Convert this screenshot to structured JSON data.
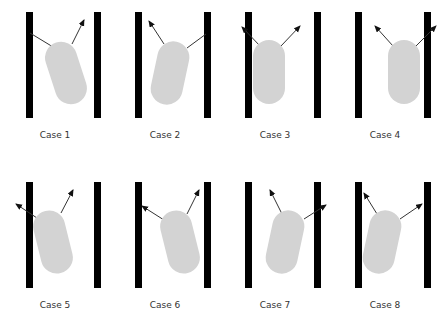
{
  "figure": {
    "colors": {
      "wall": "#000000",
      "body": "#d3d3d3",
      "arrow": "#333333",
      "label": "#333333"
    },
    "cases": [
      {
        "label": "Case 1",
        "left": 0,
        "top": 0,
        "tilt": -18,
        "cx": 66,
        "cy": 73,
        "arrows": [
          {
            "x1": 58,
            "y1": 50,
            "x2": 30,
            "y2": 33,
            "head": false
          },
          {
            "x1": 72,
            "y1": 44,
            "x2": 84,
            "y2": 20,
            "head": true
          }
        ]
      },
      {
        "label": "Case 2",
        "left": 110,
        "top": 0,
        "tilt": 12,
        "cx": 60,
        "cy": 73,
        "arrows": [
          {
            "x1": 54,
            "y1": 44,
            "x2": 39,
            "y2": 21,
            "head": true
          },
          {
            "x1": 77,
            "y1": 48,
            "x2": 96,
            "y2": 34,
            "head": false
          }
        ]
      },
      {
        "label": "Case 3",
        "left": 220,
        "top": 0,
        "tilt": 0,
        "cx": 49,
        "cy": 72,
        "arrows": [
          {
            "x1": 40,
            "y1": 46,
            "x2": 22,
            "y2": 27,
            "head": true
          },
          {
            "x1": 61,
            "y1": 46,
            "x2": 80,
            "y2": 26,
            "head": true
          }
        ]
      },
      {
        "label": "Case 4",
        "left": 330,
        "top": 0,
        "tilt": 0,
        "cx": 74,
        "cy": 72,
        "arrows": [
          {
            "x1": 63,
            "y1": 46,
            "x2": 45,
            "y2": 26,
            "head": true
          },
          {
            "x1": 86,
            "y1": 46,
            "x2": 106,
            "y2": 26,
            "head": true
          }
        ]
      },
      {
        "label": "Case 5",
        "left": 0,
        "top": 170,
        "tilt": -14,
        "cx": 53,
        "cy": 72,
        "arrows": [
          {
            "x1": 40,
            "y1": 50,
            "x2": 16,
            "y2": 34,
            "head": true
          },
          {
            "x1": 61,
            "y1": 43,
            "x2": 73,
            "y2": 20,
            "head": true
          }
        ]
      },
      {
        "label": "Case 6",
        "left": 110,
        "top": 170,
        "tilt": -14,
        "cx": 70,
        "cy": 72,
        "arrows": [
          {
            "x1": 54,
            "y1": 50,
            "x2": 32,
            "y2": 36,
            "head": true
          },
          {
            "x1": 77,
            "y1": 44,
            "x2": 89,
            "y2": 20,
            "head": true
          }
        ]
      },
      {
        "label": "Case 7",
        "left": 220,
        "top": 170,
        "tilt": 12,
        "cx": 65,
        "cy": 72,
        "arrows": [
          {
            "x1": 62,
            "y1": 44,
            "x2": 50,
            "y2": 20,
            "head": true
          },
          {
            "x1": 84,
            "y1": 49,
            "x2": 106,
            "y2": 35,
            "head": true
          }
        ]
      },
      {
        "label": "Case 8",
        "left": 330,
        "top": 170,
        "tilt": 12,
        "cx": 52,
        "cy": 72,
        "arrows": [
          {
            "x1": 47,
            "y1": 44,
            "x2": 34,
            "y2": 23,
            "head": true
          },
          {
            "x1": 70,
            "y1": 49,
            "x2": 92,
            "y2": 34,
            "head": true
          }
        ]
      }
    ]
  }
}
